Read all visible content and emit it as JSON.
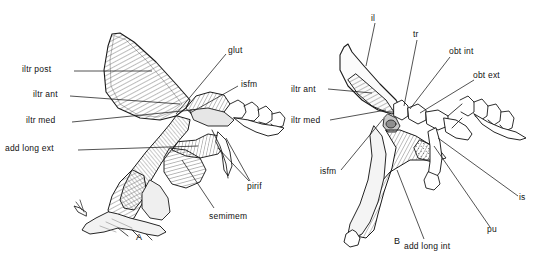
{
  "figure": {
    "type": "anatomical-illustration",
    "background_color": "#ffffff",
    "line_color": "#1a1a1a",
    "muscle_fill": "#d9d9d9",
    "stipple_fill": "#ededed"
  },
  "panels": [
    {
      "id": "A",
      "label": "A",
      "label_pos": {
        "x": 138,
        "y": 238
      },
      "labels": [
        {
          "key": "iltr_post",
          "text": "iltr post",
          "x": 22,
          "y": 69,
          "anchor": "start",
          "leader": [
            [
              74,
              74
            ],
            [
              150,
              74
            ]
          ]
        },
        {
          "key": "iltr_ant",
          "text": "iltr ant",
          "x": 33,
          "y": 94,
          "anchor": "start",
          "leader": [
            [
              74,
              99
            ],
            [
              178,
              103
            ]
          ]
        },
        {
          "key": "iltr_med",
          "text": "iltr med",
          "x": 26,
          "y": 119,
          "anchor": "start",
          "leader": [
            [
              74,
              124
            ],
            [
              190,
              108
            ]
          ]
        },
        {
          "key": "add_long_ext",
          "text": "add long ext",
          "x": 5,
          "y": 148,
          "anchor": "start",
          "leader": [
            [
              72,
              153
            ],
            [
              196,
              146
            ]
          ]
        },
        {
          "key": "glut",
          "text": "glut",
          "x": 228,
          "y": 50,
          "anchor": "start",
          "leader": [
            [
              226,
              55
            ],
            [
              176,
              114
            ]
          ]
        },
        {
          "key": "isfm",
          "text": "isfm",
          "x": 241,
          "y": 83,
          "anchor": "start",
          "leader": [
            [
              239,
              88
            ],
            [
              190,
              112
            ]
          ]
        },
        {
          "key": "pirif",
          "text": "pirif",
          "x": 249,
          "y": 186,
          "anchor": "start",
          "leader": [
            [
              249,
              182
            ],
            [
              216,
              148
            ]
          ],
          "leader2": [
            [
              249,
              182
            ],
            [
              222,
              140
            ]
          ]
        },
        {
          "key": "semimem",
          "text": "semimem",
          "x": 209,
          "y": 216,
          "anchor": "start",
          "leader": [
            [
              214,
              209
            ],
            [
              180,
              160
            ]
          ]
        }
      ]
    },
    {
      "id": "B",
      "label": "B",
      "label_pos": {
        "x": 396,
        "y": 243
      },
      "labels": [
        {
          "key": "il",
          "text": "il",
          "x": 372,
          "y": 18,
          "anchor": "start",
          "leader": [
            [
              374,
              22
            ],
            [
              366,
              65
            ]
          ]
        },
        {
          "key": "tr",
          "text": "tr",
          "x": 414,
          "y": 33,
          "anchor": "start",
          "leader": [
            [
              416,
              38
            ],
            [
              405,
              105
            ]
          ]
        },
        {
          "key": "obt_int",
          "text": "obt int",
          "x": 450,
          "y": 50,
          "anchor": "start",
          "leader": [
            [
              450,
              55
            ],
            [
              408,
              108
            ]
          ]
        },
        {
          "key": "obt_ext",
          "text": "obt ext",
          "x": 474,
          "y": 74,
          "anchor": "start",
          "leader": [
            [
              474,
              78
            ],
            [
              418,
              112
            ]
          ]
        },
        {
          "key": "iltr_ant_b",
          "text": "iltr ant",
          "x": 290,
          "y": 87,
          "anchor": "start",
          "leader": [
            [
              330,
              91
            ],
            [
              370,
              93
            ]
          ]
        },
        {
          "key": "iltr_med_b",
          "text": "iltr med",
          "x": 290,
          "y": 119,
          "anchor": "start",
          "leader": [
            [
              330,
              122
            ],
            [
              384,
              110
            ]
          ]
        },
        {
          "key": "isfm_b",
          "text": "isfm",
          "x": 322,
          "y": 175,
          "anchor": "start",
          "leader": [
            [
              340,
              171
            ],
            [
              382,
              118
            ]
          ]
        },
        {
          "key": "is",
          "text": "is",
          "x": 520,
          "y": 200,
          "anchor": "start",
          "leader": [
            [
              520,
              196
            ],
            [
              437,
              139
            ]
          ]
        },
        {
          "key": "pu",
          "text": "pu",
          "x": 488,
          "y": 233,
          "anchor": "start",
          "leader": [
            [
              490,
              228
            ],
            [
              435,
              145
            ]
          ]
        },
        {
          "key": "add_long_int",
          "text": "add long int",
          "x": 406,
          "y": 247,
          "anchor": "start",
          "leader": [
            [
              425,
              240
            ],
            [
              398,
              170
            ]
          ]
        }
      ]
    }
  ],
  "all_label_texts": [
    "iltr post",
    "iltr ant",
    "iltr med",
    "add long ext",
    "glut",
    "isfm",
    "pirif",
    "semimem",
    "A",
    "il",
    "tr",
    "obt int",
    "obt ext",
    "iltr ant",
    "iltr med",
    "isfm",
    "is",
    "pu",
    "add long int",
    "B"
  ]
}
